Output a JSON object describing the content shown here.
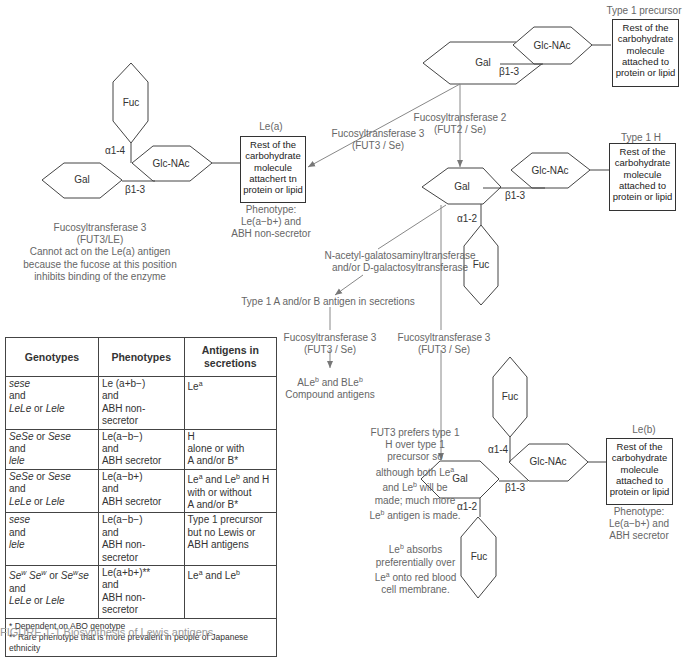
{
  "labels": {
    "type1_precursor": "Type 1 precursor",
    "type1_h": "Type 1 H",
    "le_a": "Le(a)",
    "le_b": "Le(b)",
    "residue_box": "Rest of the carbohydrate molecule attached to protein or lipid",
    "residue_box_lea": "Rest of the carbohydrate molecule attachert tn protein or lipid",
    "sugars": {
      "gal": "Gal",
      "glcnac": "Glc-NAc",
      "fuc": "Fuc"
    },
    "linkages": {
      "b13": "β1-3",
      "a14": "α1-4",
      "a12": "α1-2"
    }
  },
  "enzymes": {
    "fut3_to_lea": [
      "Fucosyltransferase 3",
      "(FUT3 / Se)"
    ],
    "fut2": [
      "Fucosyltransferase 2",
      "(FUT2 / Se)"
    ],
    "galnac": [
      "N-acetyl-galatosaminyltransferase",
      "and/or D-galactosyltransferase"
    ],
    "fut3_secretions": [
      "Fucosyltransferase 3",
      "(FUT3 / Se)"
    ],
    "fut3_to_leb": [
      "Fucosyltransferase 3",
      "(FUT3 / Se)"
    ]
  },
  "phenotypes": {
    "lea": [
      "Phenotype:",
      "Le(a−b+) and",
      "ABH non-secretor"
    ],
    "leb": [
      "Phenotype:",
      "Le(a−b+) and",
      "ABH secretor"
    ]
  },
  "notes": {
    "fut3_le": [
      "Fucosyltransferase 3",
      "(FUT3/LE)",
      "Cannot act on the Le(a) antigen",
      "because the fucose at this position",
      "inhibits binding of the enzyme"
    ],
    "type1_ab": "Type 1 A and/or B antigen in secretions",
    "compound": [
      "ALe",
      "b",
      " and BLe",
      "b",
      "Compound antigens"
    ],
    "fut3_pref": [
      "FUT3 prefers type 1",
      "H over type 1",
      "precursor so",
      "although both Le",
      "a",
      "and Le",
      "b",
      " will be",
      "made; much more",
      "Le",
      "b",
      " antigen is made."
    ],
    "leb_absorb": [
      "Le",
      "b",
      " absorbs",
      "preferentially over",
      "Le",
      "a",
      " onto red blood",
      "cell membrane."
    ]
  },
  "table": {
    "headers": [
      "Genotypes",
      "Phenotypes",
      "Antigens in secretions"
    ],
    "rows": [
      {
        "genotype": [
          "sese",
          "and",
          "LeLe",
          " or ",
          "Lele"
        ],
        "phenotype": [
          "Le (a+b−)",
          "and",
          "ABH non-secretor"
        ],
        "antigens": [
          "Le",
          "a"
        ]
      },
      {
        "genotype": [
          "SeSe",
          " or ",
          "Sese",
          "and",
          "lele"
        ],
        "phenotype": [
          "Le(a−b−)",
          "and",
          "ABH secretor"
        ],
        "antigens": [
          "H",
          "alone or with",
          "A and/or B*"
        ]
      },
      {
        "genotype": [
          "SeSe",
          " or ",
          "Sese",
          "and",
          "LeLe",
          " or ",
          "Lele"
        ],
        "phenotype": [
          "Le(a−b+)",
          "and",
          "ABH secretor"
        ],
        "antigens": [
          "Le",
          "a",
          " and Le",
          "b",
          " and H",
          "with or without",
          "A and/or B*"
        ]
      },
      {
        "genotype": [
          "sese",
          "and",
          "lele"
        ],
        "phenotype": [
          "Le(a−b−)",
          "and",
          "ABH non-secretor"
        ],
        "antigens": [
          "Type 1 precursor",
          "but no Lewis or",
          "ABH antigens"
        ]
      },
      {
        "genotype": [
          "Se",
          "w",
          " Se",
          "w",
          " or ",
          "Se",
          "w",
          "se",
          "and",
          "LeLe",
          " or ",
          "Lele"
        ],
        "phenotype": [
          "Le(a+b+)**",
          "and",
          "ABH non-secretor"
        ],
        "antigens": [
          "Le",
          "a",
          " and Le",
          "b"
        ]
      }
    ],
    "footnotes": [
      "* Dependent on ABO genotype",
      "** Rare phenotype that is more prevalent in people of Japanese ethnicity"
    ]
  },
  "caption": "FIGURE 1-1 Biosynthesis of Lewis antigens"
}
